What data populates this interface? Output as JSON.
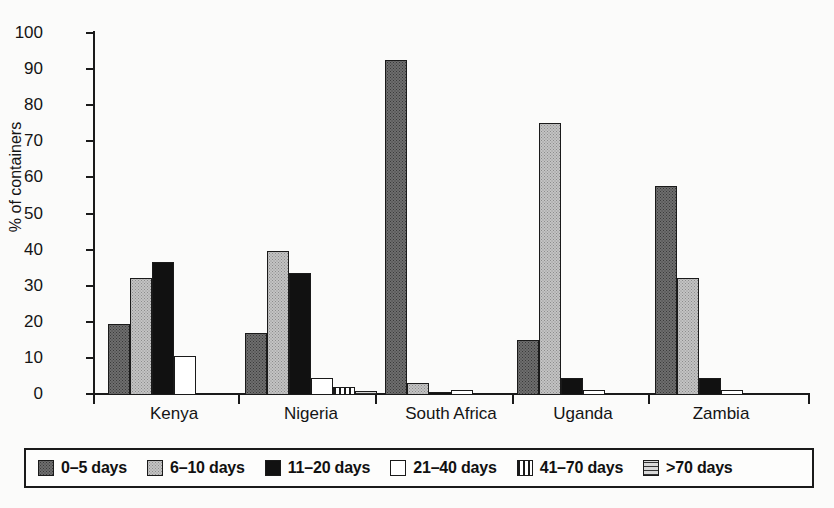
{
  "chart_data": {
    "type": "bar",
    "title": "",
    "xlabel": "",
    "ylabel": "% of containers",
    "ylim": [
      0,
      100
    ],
    "ytick_values": [
      100,
      90,
      80,
      70,
      60,
      50,
      40,
      30,
      20,
      10,
      0
    ],
    "ytick_labels": [
      "100",
      "90",
      "80",
      "70",
      "60",
      "50",
      "40",
      "30",
      "20",
      "10",
      "0"
    ],
    "grid": false,
    "legend_position": "bottom",
    "categories": [
      "Kenya",
      "Nigeria",
      "South Africa",
      "Uganda",
      "Zambia"
    ],
    "series": [
      {
        "name": "0–5 days",
        "values": [
          19.5,
          17.0,
          92.5,
          15.0,
          57.5
        ]
      },
      {
        "name": "6–10 days",
        "values": [
          32.0,
          39.5,
          3.0,
          75.0,
          32.0
        ]
      },
      {
        "name": "11–20 days",
        "values": [
          36.5,
          33.5,
          0.5,
          4.5,
          4.5
        ]
      },
      {
        "name": "21–40 days",
        "values": [
          10.5,
          4.5,
          1.0,
          1.0,
          1.0
        ]
      },
      {
        "name": "41–70 days",
        "values": [
          0.0,
          2.0,
          0.0,
          0.0,
          0.0
        ]
      },
      {
        "name": ">70 days",
        "values": [
          0.3,
          0.8,
          0.0,
          0.0,
          0.0
        ]
      }
    ]
  },
  "legend": {
    "items": [
      {
        "label": "0–5 days",
        "swatch": "dark-grey-stipple"
      },
      {
        "label": "6–10 days",
        "swatch": "light-grey-stipple"
      },
      {
        "label": "11–20 days",
        "swatch": "solid-black"
      },
      {
        "label": "21–40 days",
        "swatch": "white"
      },
      {
        "label": "41–70 days",
        "swatch": "vertical-stripes"
      },
      {
        "label": ">70 days",
        "swatch": "horizontal-stripes"
      }
    ]
  },
  "colors": {
    "axis": "#1a1a1a",
    "background": "#fbfbfa",
    "series_0": "#6e6e6e",
    "series_1": "#c3c3c3",
    "series_2": "#111111",
    "series_3": "#ffffff",
    "series_4": "#ffffff",
    "series_5": "#b9b9b9"
  }
}
